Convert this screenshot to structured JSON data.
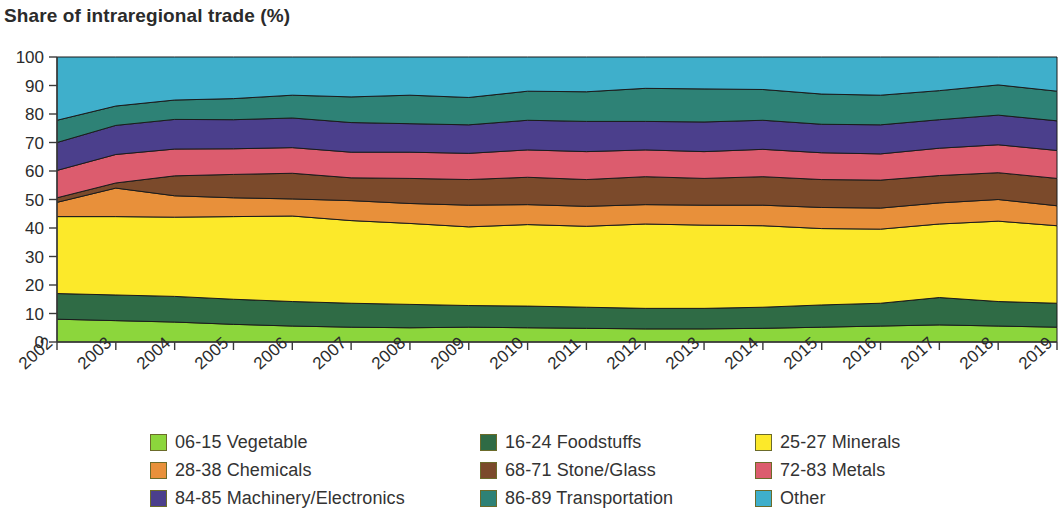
{
  "title": "Share of intraregional trade (%)",
  "axis": {
    "y_ticks": [
      "100",
      "90",
      "80",
      "70",
      "60",
      "50",
      "40",
      "30",
      "20",
      "10",
      "0"
    ],
    "x_ticks": [
      "2002",
      "2003",
      "2004",
      "2005",
      "2006",
      "2007",
      "2008",
      "2009",
      "2010",
      "2011",
      "2012",
      "2013",
      "2014",
      "2015",
      "2016",
      "2017",
      "2018",
      "2019"
    ]
  },
  "legend": {
    "items": [
      {
        "label": "06-15 Vegetable",
        "color": "#8CD63C"
      },
      {
        "label": "16-24 Foodstuffs",
        "color": "#2F6B45"
      },
      {
        "label": "25-27 Minerals",
        "color": "#FCE92A"
      },
      {
        "label": "28-38 Chemicals",
        "color": "#E8903A"
      },
      {
        "label": "68-71 Stone/Glass",
        "color": "#7B4A2B"
      },
      {
        "label": "72-83 Metals",
        "color": "#DC5C6E"
      },
      {
        "label": "84-85 Machinery/Electronics",
        "color": "#4B3F8C"
      },
      {
        "label": "86-89 Transportation",
        "color": "#2E8276"
      },
      {
        "label": "Other",
        "color": "#3FAFCB"
      }
    ]
  },
  "chart_data": {
    "type": "area",
    "stacked": true,
    "title": "Share of intraregional trade (%)",
    "xlabel": "",
    "ylabel": "Share of intraregional trade (%)",
    "ylim": [
      0,
      100
    ],
    "grid": false,
    "legend_position": "bottom",
    "x": [
      "2002",
      "2003",
      "2004",
      "2005",
      "2006",
      "2007",
      "2008",
      "2009",
      "2010",
      "2011",
      "2012",
      "2013",
      "2014",
      "2015",
      "2016",
      "2017",
      "2018",
      "2019"
    ],
    "series": [
      {
        "name": "06-15 Vegetable",
        "color": "#8CD63C",
        "values": [
          8.0,
          7.5,
          7.0,
          6.2,
          5.6,
          5.2,
          5.0,
          5.2,
          5.0,
          4.8,
          4.6,
          4.6,
          4.8,
          5.2,
          5.6,
          6.0,
          5.6,
          5.2
        ]
      },
      {
        "name": "16-24 Foodstuffs",
        "color": "#2F6B45",
        "values": [
          9.0,
          9.0,
          9.0,
          8.8,
          8.6,
          8.4,
          8.2,
          7.6,
          7.6,
          7.4,
          7.2,
          7.2,
          7.4,
          7.8,
          8.0,
          9.6,
          8.6,
          8.4
        ]
      },
      {
        "name": "25-27 Minerals",
        "color": "#FCE92A",
        "values": [
          27.0,
          27.5,
          27.8,
          29.0,
          30.0,
          29.0,
          28.4,
          27.6,
          28.6,
          28.4,
          29.6,
          29.2,
          28.6,
          26.8,
          26.0,
          25.8,
          28.2,
          27.2
        ]
      },
      {
        "name": "28-38 Chemicals",
        "color": "#E8903A",
        "values": [
          5.0,
          10.0,
          7.5,
          6.6,
          6.0,
          7.0,
          7.0,
          7.6,
          7.0,
          7.0,
          6.8,
          7.0,
          7.2,
          7.4,
          7.4,
          7.4,
          7.6,
          7.0
        ]
      },
      {
        "name": "68-71 Stone/Glass",
        "color": "#7B4A2B",
        "values": [
          1.6,
          1.8,
          7.0,
          8.2,
          9.0,
          8.0,
          8.8,
          9.0,
          9.6,
          9.4,
          9.8,
          9.4,
          10.0,
          9.8,
          9.8,
          9.6,
          9.4,
          9.6
        ]
      },
      {
        "name": "72-83 Metals",
        "color": "#DC5C6E",
        "values": [
          9.6,
          10.0,
          9.4,
          9.0,
          9.0,
          9.0,
          9.2,
          9.2,
          9.6,
          9.8,
          9.4,
          9.4,
          9.6,
          9.4,
          9.2,
          9.6,
          9.8,
          9.8
        ]
      },
      {
        "name": "84-85 Machinery/Electronics",
        "color": "#4B3F8C",
        "values": [
          9.8,
          10.2,
          10.4,
          10.2,
          10.4,
          10.4,
          10.0,
          10.0,
          10.4,
          10.6,
          10.0,
          10.4,
          10.2,
          10.0,
          10.2,
          10.0,
          10.4,
          10.4
        ]
      },
      {
        "name": "86-89 Transportation",
        "color": "#2E8276",
        "values": [
          7.8,
          6.8,
          6.8,
          7.4,
          8.0,
          9.0,
          10.0,
          9.6,
          10.2,
          10.4,
          11.6,
          11.6,
          10.8,
          10.6,
          10.4,
          10.2,
          10.6,
          10.4
        ]
      },
      {
        "name": "Other",
        "color": "#3FAFCB",
        "values": [
          22.2,
          17.2,
          15.1,
          14.6,
          13.4,
          14.0,
          13.4,
          14.2,
          12.0,
          12.2,
          11.0,
          11.2,
          11.4,
          13.0,
          13.4,
          11.8,
          9.8,
          12.0
        ]
      }
    ]
  }
}
